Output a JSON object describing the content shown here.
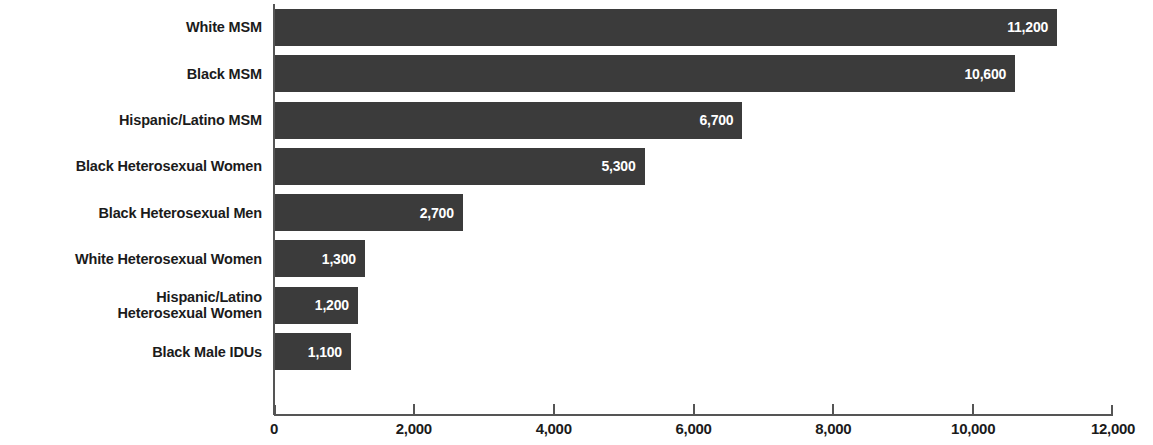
{
  "chart_data": {
    "type": "bar",
    "orientation": "horizontal",
    "title": "",
    "xlabel": "",
    "ylabel": "",
    "xlim": [
      0,
      12000
    ],
    "grid": false,
    "legend": null,
    "bar_color": "#3b3b3b",
    "value_label_color": "#ffffff",
    "categories": [
      "White MSM",
      "Black MSM",
      "Hispanic/Latino MSM",
      "Black Heterosexual Women",
      "Black Heterosexual Men",
      "White Heterosexual Women",
      "Hispanic/Latino\nHeterosexual Women",
      "Black Male IDUs"
    ],
    "values": [
      11200,
      10600,
      6700,
      5300,
      2700,
      1300,
      1200,
      1100
    ],
    "value_labels": [
      "11,200",
      "10,600",
      "6,700",
      "5,300",
      "2,700",
      "1,300",
      "1,200",
      "1,100"
    ],
    "xticks": [
      0,
      2000,
      4000,
      6000,
      8000,
      10000,
      12000
    ],
    "xtick_labels": [
      "0",
      "2,000",
      "4,000",
      "6,000",
      "8,000",
      "10,000",
      "12,000"
    ]
  }
}
